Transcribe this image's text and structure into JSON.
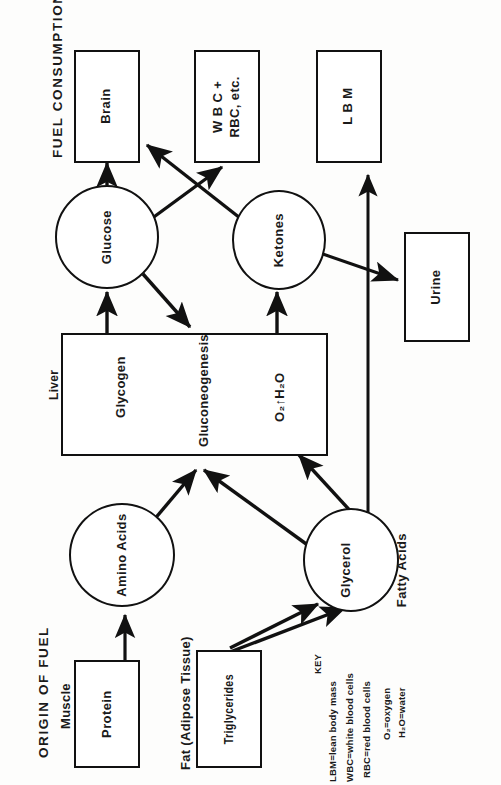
{
  "figure": {
    "orientation": "rotated-90-ccw",
    "ink_color": "#111111",
    "paper_color": "#fdfdfc"
  },
  "headings": {
    "fuel_consumption": "FUEL  CONSUMPTION",
    "origin_of_fuel": "ORIGIN OF FUEL"
  },
  "group_labels": {
    "muscle": "Muscle",
    "fat_adipose": "Fat (Adipose Tissue)",
    "liver": "Liver"
  },
  "nodes": {
    "brain": "Brain",
    "wbc_rbc_line1": "W B C +",
    "wbc_rbc_line2": "RBC, etc.",
    "lbm": "L B M",
    "urine": "Urine",
    "glucose": "Glucose",
    "ketones": "Ketones",
    "amino_acids": "Amino Acids",
    "glycerol": "Glycerol",
    "fatty_acids": "Fatty Acids",
    "protein": "Protein",
    "triglycerides": "Triglycerides",
    "glycogen": "Glycogen",
    "gluconeogenesis": "Gluconeogenesis",
    "o2_h2o": "O₂↑H₂O"
  },
  "key": {
    "title": "KEY",
    "entries": [
      "LBM=lean body mass",
      "WBC=white blood cells",
      "RBC=red blood cells",
      "O₂=oxygen",
      "H₂O=water"
    ]
  },
  "flows": [
    {
      "from": "Protein",
      "to": "Amino Acids"
    },
    {
      "from": "Amino Acids",
      "to": "Gluconeogenesis"
    },
    {
      "from": "Triglycerides",
      "to": "Glycerol"
    },
    {
      "from": "Triglycerides",
      "to": "Fatty Acids"
    },
    {
      "from": "Glycerol",
      "to": "Gluconeogenesis"
    },
    {
      "from": "Fatty Acids",
      "to": "O₂↑H₂O"
    },
    {
      "from": "Fatty Acids",
      "to": "L B M"
    },
    {
      "from": "Glycogen",
      "to": "Glucose"
    },
    {
      "from": "Glucose",
      "to": "Brain"
    },
    {
      "from": "Glucose",
      "to": "W B C + RBC, etc."
    },
    {
      "from": "Ketones",
      "to": "Brain"
    },
    {
      "from": "Ketones",
      "to": "Urine"
    },
    {
      "from": "Liver",
      "to": "Ketones"
    },
    {
      "from": "Glucose",
      "to": "Gluconeogenesis"
    }
  ]
}
